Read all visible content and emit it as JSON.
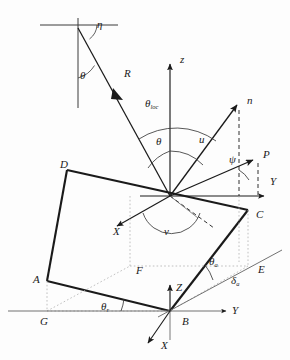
{
  "figure": {
    "type": "geometry-diagram",
    "background_color": "#fdfdfd",
    "line_color": "#1a1a1a",
    "thin_line_color": "#555555",
    "dotted_line_color": "#9a9a9a"
  },
  "labels": {
    "eta": {
      "text": "η",
      "x": 97,
      "y": 25
    },
    "theta_top": {
      "text": "θ",
      "x": 80,
      "y": 76
    },
    "R": {
      "text": "R",
      "x": 124,
      "y": 74
    },
    "z_axis": {
      "text": "z",
      "x": 180,
      "y": 60
    },
    "theta_loc_base": {
      "text": "θ",
      "x": 145,
      "y": 104
    },
    "theta_loc_sub": {
      "text": "loc",
      "x": 152,
      "y": 110
    },
    "n_vector": {
      "text": "n",
      "x": 247,
      "y": 101
    },
    "theta_mid": {
      "text": "θ",
      "x": 156,
      "y": 142
    },
    "u_angle": {
      "text": "u",
      "x": 199,
      "y": 140
    },
    "psi_angle": {
      "text": "ψ",
      "x": 229,
      "y": 160
    },
    "P_vector": {
      "text": "P",
      "x": 263,
      "y": 155
    },
    "Y_upper": {
      "text": "Y",
      "x": 270,
      "y": 182
    },
    "D_corner": {
      "text": "D",
      "x": 60,
      "y": 165
    },
    "C_corner": {
      "text": "C",
      "x": 256,
      "y": 215
    },
    "X_upper": {
      "text": "X",
      "x": 113,
      "y": 232
    },
    "v_angle": {
      "text": "v",
      "x": 164,
      "y": 232
    },
    "A_corner": {
      "text": "A",
      "x": 37,
      "y": 280
    },
    "F_corner": {
      "text": "F",
      "x": 136,
      "y": 271
    },
    "E_corner": {
      "text": "E",
      "x": 258,
      "y": 270
    },
    "theta_a_base": {
      "text": "θ",
      "x": 209,
      "y": 262
    },
    "theta_a_sub": {
      "text": "a",
      "x": 216,
      "y": 268
    },
    "delta_a_base": {
      "text": "δ",
      "x": 231,
      "y": 281
    },
    "delta_a_sub": {
      "text": "a",
      "x": 237,
      "y": 287
    },
    "Z_lower": {
      "text": "Z",
      "x": 176,
      "y": 288
    },
    "theta_r_base": {
      "text": "θ",
      "x": 101,
      "y": 307
    },
    "theta_r_sub": {
      "text": "r",
      "x": 107,
      "y": 313
    },
    "G_corner": {
      "text": "G",
      "x": 43,
      "y": 342
    },
    "B_origin": {
      "text": "B",
      "x": 182,
      "y": 336
    },
    "Y_lower": {
      "text": "Y",
      "x": 234,
      "y": 325
    },
    "X_lower": {
      "text": "X",
      "x": 164,
      "y": 350
    }
  },
  "geometry": {
    "apex": {
      "x": 170,
      "y": 196
    },
    "incident_ray": {
      "from_x": 78,
      "from_y": 28,
      "to_x": 170,
      "to_y": 196
    },
    "cross_center": {
      "x": 78,
      "y": 28
    },
    "z_axis": {
      "from_x": 170,
      "from_y": 196,
      "to_x": 170,
      "to_y": 62
    },
    "n_vector": {
      "from_x": 170,
      "from_y": 196,
      "to_x": 238,
      "to_y": 104
    },
    "p_vector": {
      "from_x": 170,
      "from_y": 196,
      "to_x": 255,
      "to_y": 158
    },
    "y_upper_axis": {
      "from_x": 170,
      "from_y": 196,
      "to_x": 266,
      "to_y": 196
    },
    "x_upper_axis": {
      "from_x": 170,
      "from_y": 196,
      "to_x": 114,
      "to_y": 228
    },
    "facet": {
      "D": {
        "x": 67,
        "y": 170
      },
      "C": {
        "x": 248,
        "y": 210
      },
      "B": {
        "x": 170,
        "y": 311
      },
      "A": {
        "x": 47,
        "y": 281
      }
    },
    "ground_quad": {
      "F": {
        "x": 130,
        "y": 266
      },
      "E": {
        "x": 248,
        "y": 266
      },
      "B": {
        "x": 170,
        "y": 311
      },
      "G": {
        "x": 47,
        "y": 311
      }
    },
    "ground_line": {
      "from_x": 10,
      "from_y": 311,
      "to_x": 228,
      "to_y": 311
    },
    "slope_line": {
      "from_x": 170,
      "from_y": 311,
      "to_x": 280,
      "to_y": 252
    },
    "lower_origin": {
      "x": 170,
      "y": 311
    },
    "z_lower_axis": {
      "from_x": 170,
      "from_y": 311,
      "to_x": 170,
      "to_y": 283
    },
    "y_lower_axis": {
      "from_x": 170,
      "from_y": 311,
      "to_x": 228,
      "to_y": 311
    },
    "x_lower_axis": {
      "from_x": 170,
      "from_y": 311,
      "to_x": 146,
      "to_y": 345
    }
  }
}
